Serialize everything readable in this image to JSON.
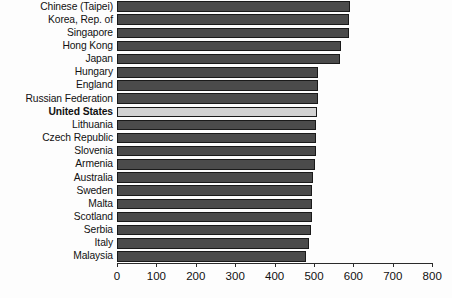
{
  "chart_data": {
    "type": "bar",
    "orientation": "horizontal",
    "title": "",
    "subtitle": "",
    "xlabel": "",
    "ylabel": "",
    "xlim": [
      0,
      800
    ],
    "xticks": [
      0,
      100,
      200,
      300,
      400,
      500,
      600,
      700,
      800
    ],
    "xtick_labels": [
      "0",
      "100",
      "200",
      "300",
      "400",
      "500",
      "600",
      "700",
      "800"
    ],
    "grid": false,
    "legend": false,
    "legend_position": "none",
    "highlight_category": "United States",
    "colors": {
      "bar": "#4b4b4b",
      "bar_highlight": "#d2d2d2",
      "bar_outline": "#1a1a1a",
      "axis": "#2a2a2a",
      "text": "#111111",
      "background": "#fdfdfd"
    },
    "categories": [
      "Chinese (Taipei)",
      "Korea, Rep. of",
      "Singapore",
      "Hong Kong",
      "Japan",
      "Hungary",
      "England",
      "Russian Federation",
      "United States",
      "Lithuania",
      "Czech Republic",
      "Slovenia",
      "Armenia",
      "Australia",
      "Sweden",
      "Malta",
      "Scotland",
      "Serbia",
      "Italy",
      "Malaysia"
    ],
    "values": [
      591,
      588,
      589,
      568,
      566,
      510,
      510,
      509,
      507,
      505,
      504,
      504,
      503,
      498,
      496,
      495,
      494,
      492,
      487,
      480
    ]
  }
}
